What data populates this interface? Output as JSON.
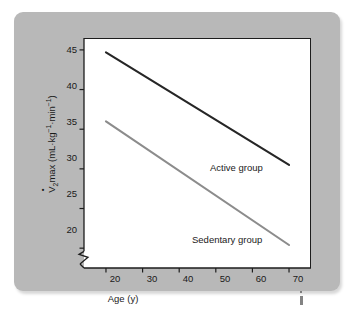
{
  "figure": {
    "panel_bg": "#b8b8b8",
    "plot_bg": "#ffffff",
    "axis_color": "#1d1d1d"
  },
  "chart_data": {
    "type": "line",
    "title": "",
    "xlabel": "Age (y)",
    "ylabel": "VO2max (mL·kg⁻¹·min⁻¹)",
    "ylabel_parts": {
      "symbol": "V",
      "sub": "2",
      "word": "max",
      "units": "(mL·kg",
      "sup1": "-1",
      "mid": "·min",
      "sup2": "-1",
      "close": ")"
    },
    "xlim": [
      14,
      76
    ],
    "ylim": [
      17.5,
      46.5
    ],
    "xticks": [
      20,
      30,
      40,
      50,
      60,
      70
    ],
    "xtick_labels": [
      "20",
      "30",
      "40",
      "50",
      "60",
      "70"
    ],
    "yticks": [
      20,
      25,
      30,
      35,
      40,
      45
    ],
    "ytick_labels": [
      "20",
      "25",
      "30",
      "35",
      "40",
      "45"
    ],
    "grid": false,
    "axis_break": {
      "axis": "y",
      "below": 20,
      "style": "zigzag"
    },
    "legend_position": "inline-annotations",
    "x": [
      20,
      70
    ],
    "series": [
      {
        "name": "Active group",
        "label": "Active group",
        "color": "#262626",
        "width": 2.1,
        "values": [
          44.7,
          30.5
        ]
      },
      {
        "name": "Sedentary group",
        "label": "Sedentary group",
        "color": "#8c8c8c",
        "width": 2.1,
        "values": [
          36.0,
          20.4
        ]
      }
    ],
    "annotations": [
      {
        "text": "Active group",
        "x": 53,
        "y": 28.5
      },
      {
        "text": "Sedentary group",
        "x": 45,
        "y": 21.3
      }
    ]
  }
}
